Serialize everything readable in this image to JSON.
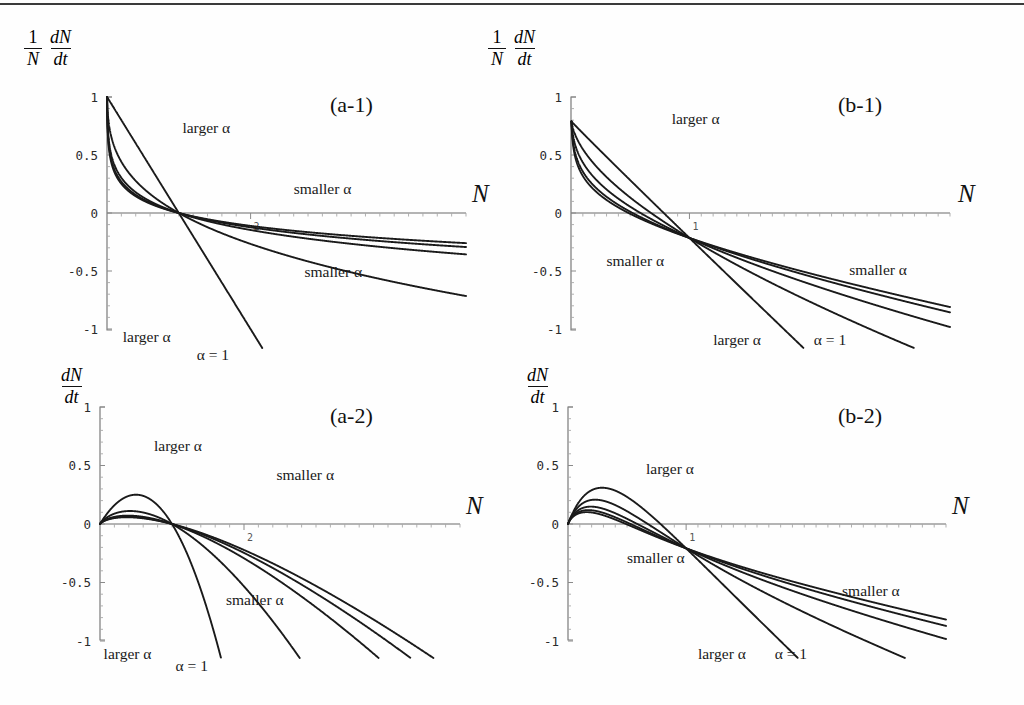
{
  "figure": {
    "axis_x_name": "N",
    "labels": {
      "larger_alpha": "larger α",
      "smaller_alpha": "smaller α",
      "alpha_equals_one": "α = 1"
    }
  },
  "chart_data": [
    {
      "id": "a-1",
      "type": "line",
      "tag": "(a-1)",
      "ylabel_numerator": "1",
      "ylabel_denominator": "N",
      "ylabel_frac_num": "dN",
      "ylabel_frac_den": "dt",
      "xlabel": "N",
      "xlim": [
        0,
        5
      ],
      "ylim": [
        -1,
        1
      ],
      "xticks": [
        2
      ],
      "xticklabels": [
        "2"
      ],
      "yticks": [
        -1,
        -0.5,
        0,
        0.5,
        1
      ],
      "yticklabels": [
        "-1",
        "-0.5",
        "0",
        "0.5",
        "1"
      ],
      "grid": false,
      "annotations": [
        {
          "text": "larger α",
          "x": 1.05,
          "y": 0.72
        },
        {
          "text": "smaller α",
          "x": 2.6,
          "y": 0.2
        },
        {
          "text": "smaller α",
          "x": 2.75,
          "y": -0.52
        },
        {
          "text": "larger α",
          "x": 0.22,
          "y": -1.08
        },
        {
          "text": "α = 1",
          "x": 1.25,
          "y": -1.23
        }
      ],
      "series": [
        {
          "name": "alpha = 1",
          "alpha": 1.0
        },
        {
          "name": "alpha = 0.3",
          "alpha": 0.3
        },
        {
          "name": "alpha = 0.1",
          "alpha": 0.1
        },
        {
          "name": "alpha = 0.05",
          "alpha": 0.05
        },
        {
          "name": "alpha = 0.02",
          "alpha": 0.02
        }
      ]
    },
    {
      "id": "b-1",
      "type": "line",
      "tag": "(b-1)",
      "ylabel_numerator": "1",
      "ylabel_denominator": "N",
      "ylabel_frac_num": "dN",
      "ylabel_frac_den": "dt",
      "xlabel": "N",
      "xlim": [
        0,
        3.2
      ],
      "ylim": [
        -1,
        1
      ],
      "xticks": [
        1
      ],
      "xticklabels": [
        "1"
      ],
      "yticks": [
        -1,
        -0.5,
        0,
        0.5,
        1
      ],
      "yticklabels": [
        "-1",
        "-0.5",
        "0",
        "0.5",
        "1"
      ],
      "grid": false,
      "annotations": [
        {
          "text": "larger α",
          "x": 0.85,
          "y": 0.8
        },
        {
          "text": "smaller α",
          "x": 0.3,
          "y": -0.42
        },
        {
          "text": "smaller α",
          "x": 2.35,
          "y": -0.5
        },
        {
          "text": "larger α",
          "x": 1.2,
          "y": -1.1
        },
        {
          "text": "α = 1",
          "x": 2.05,
          "y": -1.1
        }
      ],
      "series": [
        {
          "name": "alpha = 1",
          "alpha": 1.0
        },
        {
          "name": "alpha = 0.5",
          "alpha": 0.5
        },
        {
          "name": "alpha = 0.25",
          "alpha": 0.25
        },
        {
          "name": "alpha = 0.1",
          "alpha": 0.1
        },
        {
          "name": "alpha = 0.03",
          "alpha": 0.03
        }
      ]
    },
    {
      "id": "a-2",
      "type": "line",
      "tag": "(a-2)",
      "ylabel_frac_num": "dN",
      "ylabel_frac_den": "dt",
      "xlabel": "N",
      "xlim": [
        0,
        5
      ],
      "ylim": [
        -1,
        1
      ],
      "xticks": [
        2
      ],
      "xticklabels": [
        "2"
      ],
      "yticks": [
        -1,
        -0.5,
        0,
        0.5,
        1
      ],
      "yticklabels": [
        "-1",
        "-0.5",
        "0",
        "0.5",
        "1"
      ],
      "grid": false,
      "annotations": [
        {
          "text": "larger α",
          "x": 0.75,
          "y": 0.66
        },
        {
          "text": "smaller α",
          "x": 2.45,
          "y": 0.41
        },
        {
          "text": "smaller α",
          "x": 1.75,
          "y": -0.66
        },
        {
          "text": "larger α",
          "x": 0.05,
          "y": -1.12
        },
        {
          "text": "α = 1",
          "x": 1.05,
          "y": -1.22
        }
      ],
      "series": [
        {
          "name": "alpha = 1",
          "alpha": 1.0
        },
        {
          "name": "alpha = 0.3",
          "alpha": 0.3
        },
        {
          "name": "alpha = 0.1",
          "alpha": 0.1
        },
        {
          "name": "alpha = 0.05",
          "alpha": 0.05
        },
        {
          "name": "alpha = 0.02",
          "alpha": 0.02
        }
      ]
    },
    {
      "id": "b-2",
      "type": "line",
      "tag": "(b-2)",
      "ylabel_frac_num": "dN",
      "ylabel_frac_den": "dt",
      "xlabel": "N",
      "xlim": [
        0,
        3.2
      ],
      "ylim": [
        -1,
        1
      ],
      "xticks": [
        1
      ],
      "xticklabels": [
        "1"
      ],
      "yticks": [
        -1,
        -0.5,
        0,
        0.5,
        1
      ],
      "yticklabels": [
        "-1",
        "-0.5",
        "0",
        "0.5",
        "1"
      ],
      "grid": false,
      "annotations": [
        {
          "text": "larger α",
          "x": 0.66,
          "y": 0.46
        },
        {
          "text": "smaller α",
          "x": 0.5,
          "y": -0.3
        },
        {
          "text": "smaller α",
          "x": 2.32,
          "y": -0.58
        },
        {
          "text": "larger α",
          "x": 1.1,
          "y": -1.12
        },
        {
          "text": "α = 1",
          "x": 1.75,
          "y": -1.12
        }
      ],
      "series": [
        {
          "name": "alpha = 1",
          "alpha": 1.0
        },
        {
          "name": "alpha = 0.5",
          "alpha": 0.5
        },
        {
          "name": "alpha = 0.25",
          "alpha": 0.25
        },
        {
          "name": "alpha = 0.12",
          "alpha": 0.12
        },
        {
          "name": "alpha = 0.04",
          "alpha": 0.04
        }
      ]
    }
  ],
  "colors": {
    "curve": "#1a1a1a",
    "axis": "#7a7a7a",
    "text": "#111111",
    "background": "#fefefe"
  }
}
